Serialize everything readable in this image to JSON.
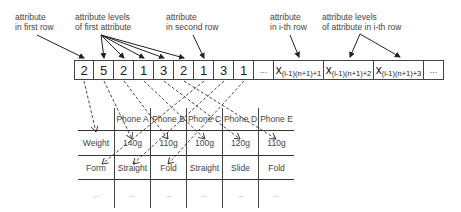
{
  "annotations": [
    {
      "id": "attr-first-row",
      "line1": "attribute",
      "line2": "in first row"
    },
    {
      "id": "levels-first-attr",
      "line1": "attribute levels",
      "line2": "of first attribute"
    },
    {
      "id": "attr-second-row",
      "line1": "attribute",
      "line2": "in second row"
    },
    {
      "id": "attr-ith-row",
      "line1": "attribute",
      "line2": "in i-th row"
    },
    {
      "id": "levels-ith-attr",
      "line1": "attribute levels",
      "line2": "of attribute in i-th row"
    }
  ],
  "sequence": {
    "values": [
      "2",
      "5",
      "2",
      "1",
      "3",
      "2",
      "1",
      "3",
      "1"
    ],
    "ellipsis": "...",
    "x_terms": [
      {
        "base": "x",
        "sub": "(i-1)(n+1)+1"
      },
      {
        "base": "x",
        "sub": "(i-1)(n+1)+2"
      },
      {
        "base": "x",
        "sub": "(i-1)(n+1)+3"
      }
    ],
    "trailing_ellipsis": "..."
  },
  "table": {
    "headers": [
      "",
      "Phone A",
      "Phone B",
      "Phone C",
      "Phone D",
      "Phone E"
    ],
    "rows": [
      [
        "Weight",
        "140g",
        "110g",
        "100g",
        "120g",
        "110g"
      ],
      [
        "Form",
        "Straight",
        "Fold",
        "Straight",
        "Slide",
        "Fold"
      ],
      [
        "...",
        "...",
        "...",
        "...",
        "...",
        "..."
      ]
    ]
  }
}
